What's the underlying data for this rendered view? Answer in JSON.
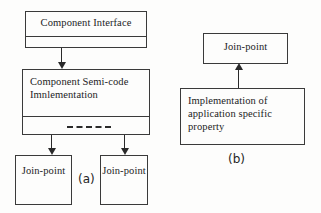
{
  "figure": {
    "background_color": "#fdfdfc",
    "stroke_color": "#3a3a3a",
    "text_color": "#1c1c1c"
  },
  "diagram_a": {
    "caption": "(a)",
    "boxes": {
      "component_interface": {
        "title": "Component Interface"
      },
      "component_semicode": {
        "title": "Component Semi-code Imnlementation"
      },
      "joinpoint_left": {
        "title": "Join-point"
      },
      "joinpoint_right": {
        "title": "Join-point"
      }
    },
    "connectors": [
      {
        "name": "interface-to-semicode",
        "from": "component_interface",
        "to": "component_semicode",
        "direction": "down"
      },
      {
        "name": "semicode-to-joinpoint-left",
        "from": "component_semicode",
        "to": "joinpoint_left",
        "direction": "down"
      },
      {
        "name": "semicode-to-joinpoint-right",
        "from": "component_semicode",
        "to": "joinpoint_right",
        "direction": "down"
      }
    ]
  },
  "diagram_b": {
    "caption": "(b)",
    "boxes": {
      "joinpoint": {
        "title": "Join-point"
      },
      "implementation": {
        "title": "Implementation of application specific property"
      }
    },
    "connectors": [
      {
        "name": "implementation-to-joinpoint",
        "from": "implementation",
        "to": "joinpoint",
        "direction": "up"
      }
    ]
  }
}
